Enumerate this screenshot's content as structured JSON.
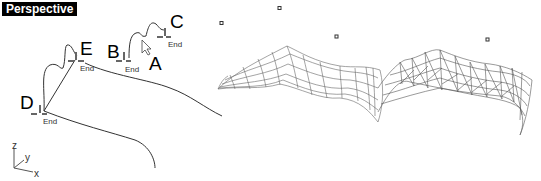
{
  "viewport": {
    "title": "Perspective",
    "background": "#ffffff",
    "title_bg": "#000000",
    "title_fg": "#ffffff"
  },
  "points": [
    {
      "label": "A"
    },
    {
      "label": "B",
      "snap": "End"
    },
    {
      "label": "C",
      "snap": "End"
    },
    {
      "label": "D",
      "snap": "End"
    },
    {
      "label": "E",
      "snap": "End"
    }
  ],
  "axes": {
    "x": "x",
    "y": "y",
    "z": "z"
  },
  "surfaces": [
    {
      "name": "quad-mesh-surface"
    },
    {
      "name": "triangulated-mesh-surface"
    }
  ]
}
